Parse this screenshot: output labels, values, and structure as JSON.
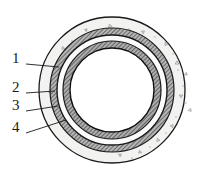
{
  "figure": {
    "kind": "engineering-cross-section-diagram",
    "background_color": "#ffffff",
    "line_color": "#1a1a1a"
  },
  "geometry": {
    "center_x": 112,
    "center_y": 90,
    "outer_radius": 73,
    "bore_radius": 42
  },
  "layers": [
    {
      "id": "concrete-surround",
      "callout": "1",
      "outer_radius": 73,
      "inner_radius": 62,
      "fill": "#f2f2f0",
      "stroke": "#1a1a1a",
      "pattern": "aggregate-speckle"
    },
    {
      "id": "outer-hatched-ring",
      "callout": "2",
      "outer_radius": 62,
      "inner_radius": 55,
      "fill": "#9a9a9a",
      "stroke": "#1a1a1a",
      "pattern": "diagonal-hatch"
    },
    {
      "id": "middle-light-ring",
      "callout": "3",
      "outer_radius": 55,
      "inner_radius": 49,
      "fill": "#fbfbfb",
      "stroke": "#1a1a1a",
      "pattern": "plain"
    },
    {
      "id": "inner-hatched-ring",
      "callout": "4",
      "outer_radius": 49,
      "inner_radius": 42,
      "fill": "#9a9a9a",
      "stroke": "#1a1a1a",
      "pattern": "diagonal-hatch"
    }
  ],
  "bore": {
    "id": "inner-bore",
    "radius": 42,
    "fill": "#ffffff"
  },
  "callouts": [
    {
      "label": "1",
      "text_x": 12,
      "text_y": 63,
      "line_start_x": 26,
      "line_start_y": 64,
      "line_end_x": 59,
      "line_end_y": 67,
      "target": "concrete-surround"
    },
    {
      "label": "2",
      "text_x": 12,
      "text_y": 92,
      "line_start_x": 26,
      "line_start_y": 93,
      "line_end_x": 55,
      "line_end_y": 91,
      "target": "outer-hatched-ring"
    },
    {
      "label": "3",
      "text_x": 12,
      "text_y": 110,
      "line_start_x": 26,
      "line_start_y": 111,
      "line_end_x": 58,
      "line_end_y": 106,
      "target": "middle-light-ring"
    },
    {
      "label": "4",
      "text_x": 12,
      "text_y": 132,
      "line_start_x": 26,
      "line_start_y": 133,
      "line_end_x": 66,
      "line_end_y": 120,
      "target": "inner-hatched-ring"
    }
  ],
  "aggregate_marks": [
    {
      "x": 110,
      "y": 26,
      "r": 2.0,
      "rot": 15
    },
    {
      "x": 143,
      "y": 32,
      "r": 1.8,
      "rot": 200
    },
    {
      "x": 86,
      "y": 30,
      "r": 1.6,
      "rot": 70
    },
    {
      "x": 166,
      "y": 44,
      "r": 1.9,
      "rot": 120
    },
    {
      "x": 63,
      "y": 48,
      "r": 1.7,
      "rot": 250
    },
    {
      "x": 177,
      "y": 63,
      "r": 2.1,
      "rot": 30
    },
    {
      "x": 186,
      "y": 74,
      "r": 1.7,
      "rot": 160
    },
    {
      "x": 54,
      "y": 68,
      "r": 1.6,
      "rot": 95
    },
    {
      "x": 181,
      "y": 96,
      "r": 1.9,
      "rot": 210
    },
    {
      "x": 190,
      "y": 110,
      "r": 1.8,
      "rot": 45
    },
    {
      "x": 50,
      "y": 92,
      "r": 1.7,
      "rot": 300
    },
    {
      "x": 57,
      "y": 112,
      "r": 1.6,
      "rot": 135
    },
    {
      "x": 69,
      "y": 131,
      "r": 1.9,
      "rot": 20
    },
    {
      "x": 94,
      "y": 146,
      "r": 2.0,
      "rot": 175
    },
    {
      "x": 120,
      "y": 155,
      "r": 1.8,
      "rot": 85
    },
    {
      "x": 140,
      "y": 152,
      "r": 1.7,
      "rot": 260
    },
    {
      "x": 158,
      "y": 140,
      "r": 1.9,
      "rot": 10
    },
    {
      "x": 172,
      "y": 126,
      "r": 1.7,
      "rot": 190
    },
    {
      "x": 100,
      "y": 40,
      "r": 1.4,
      "rot": 55
    },
    {
      "x": 78,
      "y": 140,
      "r": 1.5,
      "rot": 230
    }
  ],
  "speckle_dots": [
    {
      "x": 96,
      "y": 36
    },
    {
      "x": 129,
      "y": 29
    },
    {
      "x": 155,
      "y": 37
    },
    {
      "x": 72,
      "y": 41
    },
    {
      "x": 173,
      "y": 54
    },
    {
      "x": 60,
      "y": 58
    },
    {
      "x": 183,
      "y": 86
    },
    {
      "x": 52,
      "y": 80
    },
    {
      "x": 186,
      "y": 103
    },
    {
      "x": 53,
      "y": 103
    },
    {
      "x": 62,
      "y": 122
    },
    {
      "x": 80,
      "y": 137
    },
    {
      "x": 106,
      "y": 150
    },
    {
      "x": 132,
      "y": 158
    },
    {
      "x": 150,
      "y": 147
    },
    {
      "x": 166,
      "y": 133
    },
    {
      "x": 176,
      "y": 117
    },
    {
      "x": 88,
      "y": 145
    },
    {
      "x": 115,
      "y": 34
    },
    {
      "x": 66,
      "y": 96
    },
    {
      "x": 160,
      "y": 120
    },
    {
      "x": 145,
      "y": 40
    },
    {
      "x": 70,
      "y": 110
    },
    {
      "x": 178,
      "y": 70
    }
  ]
}
